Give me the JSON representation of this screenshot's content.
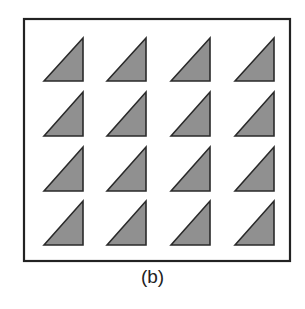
{
  "figure": {
    "caption": "(b)",
    "frame": {
      "x": 24,
      "y": 19,
      "width": 266,
      "height": 242,
      "stroke": "#222222",
      "stroke_width": 2.2
    },
    "shape": "right-triangle",
    "fill": "#909090",
    "stroke": "#2a2a2a",
    "grid": {
      "rows": 4,
      "cols": 4,
      "col_left": [
        44,
        107,
        171,
        235
      ],
      "col_right": [
        83,
        146,
        210,
        274
      ],
      "row_top": [
        38,
        92,
        147,
        201
      ],
      "row_bottom": [
        81,
        136,
        191,
        245
      ]
    }
  }
}
